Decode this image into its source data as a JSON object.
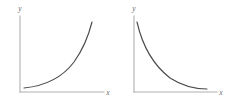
{
  "figure": {
    "name": "exponential-growth-and-decay-sketches",
    "background_color": "#ffffff",
    "axis_color": "#b0b0b0",
    "curve_color": "#4a4a4a",
    "label_color": "#6a6a6a"
  },
  "charts": [
    {
      "id": "left",
      "name": "exponential-growth-chart",
      "xlabel": "x",
      "ylabel": "y",
      "origin": {
        "x": 20,
        "y": 92
      },
      "x_axis_end": {
        "x": 104,
        "y": 92
      },
      "y_axis_top": {
        "x": 20,
        "y": 16
      },
      "x_label_pos": {
        "x": 108,
        "y": 95
      },
      "y_label_pos": {
        "x": 20,
        "y": 11
      },
      "curve": "M24,88 C44,86 62,78 74,62 C84,48 89,34 92,22"
    },
    {
      "id": "right",
      "name": "exponential-decay-chart",
      "xlabel": "x",
      "ylabel": "y",
      "origin": {
        "x": 134,
        "y": 92
      },
      "x_axis_end": {
        "x": 217,
        "y": 92
      },
      "y_axis_top": {
        "x": 134,
        "y": 16
      },
      "x_label_pos": {
        "x": 221,
        "y": 95
      },
      "y_label_pos": {
        "x": 134,
        "y": 11
      },
      "curve": "M137,22 C142,44 152,64 170,78 C184,87 198,89 207,89"
    }
  ],
  "chart_data": [
    {
      "type": "line",
      "name": "exponential-growth",
      "title": "",
      "xlabel": "x",
      "ylabel": "y",
      "legend": [],
      "grid": false,
      "axis_style": "arrowless-L-axes",
      "xlim": [
        0,
        1
      ],
      "ylim": [
        0,
        1
      ],
      "series": [
        {
          "name": "y = e^x (increasing exponential)",
          "x": [
            0.0,
            0.1,
            0.2,
            0.3,
            0.4,
            0.5,
            0.6,
            0.7,
            0.8,
            0.9,
            1.0
          ],
          "values": [
            0.05,
            0.06,
            0.08,
            0.11,
            0.15,
            0.21,
            0.29,
            0.41,
            0.56,
            0.75,
            0.95
          ]
        }
      ],
      "description": "Concave-up curve hugging the x-axis at left, rising steeply toward the upper right."
    },
    {
      "type": "line",
      "name": "exponential-decay",
      "title": "",
      "xlabel": "x",
      "ylabel": "y",
      "legend": [],
      "grid": false,
      "axis_style": "arrowless-L-axes",
      "xlim": [
        0,
        1
      ],
      "ylim": [
        0,
        1
      ],
      "series": [
        {
          "name": "y = e^-x (decreasing exponential)",
          "x": [
            0.0,
            0.1,
            0.2,
            0.3,
            0.4,
            0.5,
            0.6,
            0.7,
            0.8,
            0.9,
            1.0
          ],
          "values": [
            0.95,
            0.74,
            0.56,
            0.42,
            0.31,
            0.23,
            0.17,
            0.13,
            0.1,
            0.07,
            0.05
          ]
        }
      ],
      "description": "Concave-up curve starting high on the y-axis, falling steeply then flattening toward the x-axis."
    }
  ]
}
